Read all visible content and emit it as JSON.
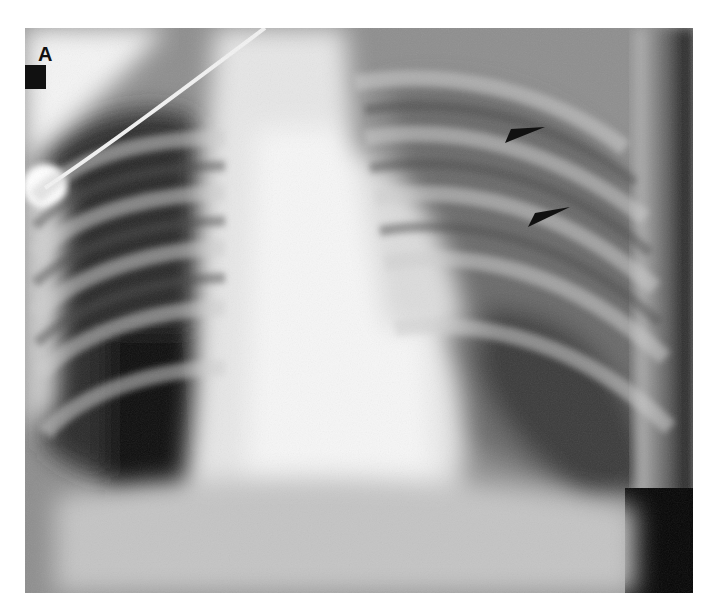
{
  "figure": {
    "panel_label": "A",
    "annotations": [
      {
        "type": "arrowhead",
        "label": "arrowhead-upper",
        "tip": [
          505,
          143
        ],
        "color": "#111111"
      },
      {
        "type": "arrowhead",
        "label": "arrowhead-lower",
        "tip": [
          528,
          227
        ],
        "color": "#111111"
      }
    ],
    "colors": {
      "background": "#ffffff",
      "lung_dark": "#1a1a1a",
      "mediastinum_bright": "#f0f0f0",
      "annotation": "#111111"
    }
  }
}
